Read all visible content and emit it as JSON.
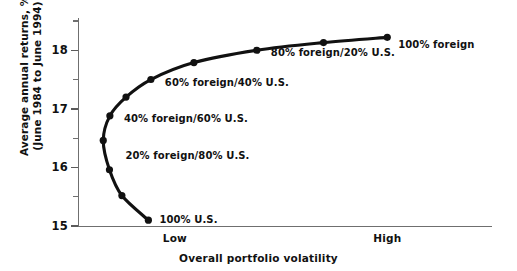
{
  "chart_data": {
    "type": "line",
    "title": "",
    "xlabel": "Overall portfolio volatility",
    "ylabel_line1": "Average annual returns, %",
    "ylabel_line2": "(June 1984 to June 1994)",
    "ylim": [
      15,
      18.55
    ],
    "yticks_major": [
      18,
      17,
      16,
      15
    ],
    "yticks_minor": [
      18.5,
      17.5,
      16.5,
      15.5
    ],
    "xticks": [
      "Low",
      "High"
    ],
    "grid": false,
    "legend": "none",
    "series_name": "Efficient frontier: foreign / U.S. allocation",
    "points": [
      {
        "label": "100% U.S.",
        "x": 0.17,
        "y": 15.1,
        "label_dx": 11,
        "label_dy": -6
      },
      {
        "label": "",
        "x": 0.106,
        "y": 15.52,
        "label_dx": 0,
        "label_dy": 0
      },
      {
        "label": "20% foreign/80% U.S.",
        "x": 0.076,
        "y": 15.96,
        "label_dx": 16,
        "label_dy": -20
      },
      {
        "label": "",
        "x": 0.061,
        "y": 16.46,
        "label_dx": 0,
        "label_dy": 0
      },
      {
        "label": "40% foreign/60% U.S.",
        "x": 0.077,
        "y": 16.88,
        "label_dx": 14,
        "label_dy": -3
      },
      {
        "label": "",
        "x": 0.116,
        "y": 17.2,
        "label_dx": 0,
        "label_dy": 0
      },
      {
        "label": "60% foreign/40% U.S.",
        "x": 0.176,
        "y": 17.5,
        "label_dx": 14,
        "label_dy": -3
      },
      {
        "label": "",
        "x": 0.28,
        "y": 17.79,
        "label_dx": 0,
        "label_dy": 0
      },
      {
        "label": "80% foreign/20% U.S.",
        "x": 0.432,
        "y": 18.0,
        "label_dx": 14,
        "label_dy": -3
      },
      {
        "label": "",
        "x": 0.593,
        "y": 18.13,
        "label_dx": 0,
        "label_dy": 0
      },
      {
        "label": "100% foreign",
        "x": 0.747,
        "y": 18.22,
        "label_dx": 11,
        "label_dy": 2
      }
    ],
    "xtick_positions": [
      0.234,
      0.747
    ],
    "colors": {
      "curve": "#111111",
      "marker": "#111111",
      "axis": "#6f6f6f",
      "text": "#111111",
      "background": "#ffffff"
    }
  }
}
